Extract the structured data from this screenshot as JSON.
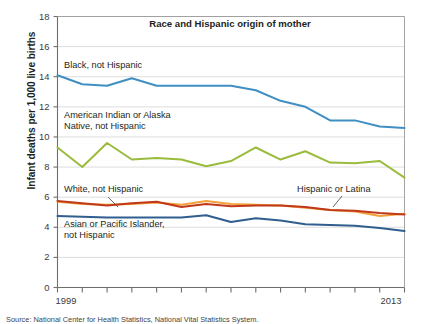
{
  "figure": {
    "y_axis_title": "Infant deaths per 1,000 live births",
    "source_note": "Source:  National Center for Health Statistics, National Vital Statistics System."
  },
  "chart_data": {
    "type": "line",
    "title": "Race and Hispanic origin of mother",
    "xlabel": "",
    "ylabel": "Infant deaths per 1,000 live births",
    "xlim": [
      1999,
      2013
    ],
    "ylim": [
      0,
      18
    ],
    "ytick_values": [
      0,
      2,
      4,
      6,
      8,
      10,
      12,
      14,
      16,
      18
    ],
    "ytick_labels": [
      "0",
      "2",
      "4",
      "6",
      "8",
      "10",
      "12",
      "14",
      "16",
      "18"
    ],
    "xtick_values": [
      1999,
      2000,
      2001,
      2002,
      2003,
      2004,
      2005,
      2006,
      2007,
      2008,
      2009,
      2010,
      2011,
      2012,
      2013
    ],
    "xtick_labels_shown": [
      "1999",
      "2013"
    ],
    "grid": "horizontal",
    "legend_position": "inline-annotations",
    "x": [
      1999,
      2000,
      2001,
      2002,
      2003,
      2004,
      2005,
      2006,
      2007,
      2008,
      2009,
      2010,
      2011,
      2012,
      2013
    ],
    "series": [
      {
        "name": "Black, not Hispanic",
        "color": "#3f8fc2",
        "values": [
          14.1,
          13.5,
          13.4,
          13.9,
          13.4,
          13.4,
          13.4,
          13.4,
          13.1,
          12.4,
          12.0,
          11.1,
          11.1,
          10.7,
          10.6
        ]
      },
      {
        "name": "American Indian or Alaska Native, not Hispanic",
        "color": "#9bbb3c",
        "values": [
          9.3,
          8.0,
          9.6,
          8.5,
          8.6,
          8.5,
          8.05,
          8.4,
          9.3,
          8.5,
          9.05,
          8.3,
          8.25,
          8.4,
          7.3
        ]
      },
      {
        "name": "White, not Hispanic",
        "color": "#c0391a",
        "values": [
          5.75,
          5.6,
          5.45,
          5.6,
          5.7,
          5.35,
          5.55,
          5.4,
          5.45,
          5.45,
          5.35,
          5.15,
          5.1,
          4.95,
          4.85
        ]
      },
      {
        "name": "Hispanic or Latina",
        "color": "#f2a13c",
        "values": [
          5.7,
          5.55,
          5.5,
          5.55,
          5.65,
          5.5,
          5.75,
          5.55,
          5.5,
          5.45,
          5.3,
          5.15,
          5.05,
          4.75,
          4.9
        ]
      },
      {
        "name": "Asian or Pacific Islander, not Hispanic",
        "color": "#2f5e8f",
        "values": [
          4.75,
          4.7,
          4.65,
          4.65,
          4.65,
          4.65,
          4.8,
          4.35,
          4.6,
          4.45,
          4.2,
          4.15,
          4.1,
          3.95,
          3.75
        ]
      }
    ],
    "annotations": [
      {
        "id": "ann-black",
        "text": "Black, not Hispanic",
        "series": "Black, not Hispanic"
      },
      {
        "id": "ann-aian-line1",
        "text": "American Indian or Alaska",
        "series": "American Indian or Alaska Native, not Hispanic"
      },
      {
        "id": "ann-aian-line2",
        "text": "Native, not Hispanic",
        "series": "American Indian or Alaska Native, not Hispanic"
      },
      {
        "id": "ann-white",
        "text": "White, not Hispanic",
        "series": "White, not Hispanic"
      },
      {
        "id": "ann-hispanic",
        "text": "Hispanic or Latina",
        "series": "Hispanic or Latina"
      },
      {
        "id": "ann-asian-line1",
        "text": "Asian or Pacific Islander,",
        "series": "Asian or Pacific Islander, not Hispanic"
      },
      {
        "id": "ann-asian-line2",
        "text": "not Hispanic",
        "series": "Asian or Pacific Islander, not Hispanic"
      }
    ]
  }
}
